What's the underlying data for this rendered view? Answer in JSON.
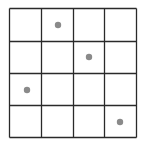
{
  "grid": {
    "rows": 4,
    "cols": 4,
    "x_lines": [
      9.5,
      41.5,
      73.5,
      104.5,
      136.5
    ],
    "y_lines": [
      8.5,
      41.5,
      73.5,
      105.5,
      137.5
    ],
    "line_color": "#2a2a2a",
    "line_width": 1.3
  },
  "dots": [
    {
      "row": 0,
      "col": 1,
      "cx": 58,
      "cy": 25
    },
    {
      "row": 1,
      "col": 2,
      "cx": 89,
      "cy": 57
    },
    {
      "row": 2,
      "col": 0,
      "cx": 27,
      "cy": 90
    },
    {
      "row": 3,
      "col": 3,
      "cx": 120,
      "cy": 122
    }
  ],
  "dot_style": {
    "radius": 3.2,
    "color": "#8a8a8a"
  }
}
